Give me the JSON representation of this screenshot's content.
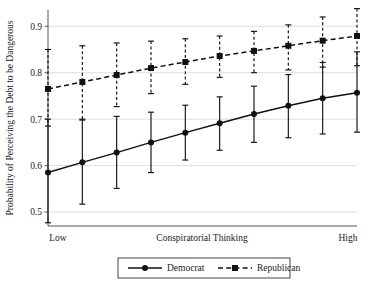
{
  "chart_data": {
    "type": "line",
    "title": "",
    "xlabel": "Conspiratorial Thinking",
    "ylabel": "Probability of Perceiving the Debt to be Dangerous",
    "xtick_labels": [
      "Low",
      "High"
    ],
    "ytick_labels": [
      "0.5",
      "0.6",
      "0.7",
      "0.8",
      "0.9"
    ],
    "yticks": [
      0.5,
      0.6,
      0.7,
      0.8,
      0.9
    ],
    "ylim": [
      0.47,
      0.935
    ],
    "xlim": [
      1,
      10
    ],
    "grid": "horizontal",
    "legend_position": "bottom-center",
    "x": [
      1,
      2,
      3,
      4,
      5,
      6,
      7,
      8,
      9,
      10
    ],
    "series": [
      {
        "name": "Democrat",
        "line_style": "solid",
        "marker": "circle",
        "color": "#111111",
        "values": [
          0.585,
          0.607,
          0.628,
          0.65,
          0.671,
          0.691,
          0.711,
          0.729,
          0.745,
          0.757
        ],
        "ci_low": [
          0.477,
          0.517,
          0.551,
          0.585,
          0.612,
          0.633,
          0.65,
          0.66,
          0.668,
          0.672
        ],
        "ci_high": [
          0.7,
          0.7,
          0.706,
          0.715,
          0.73,
          0.748,
          0.771,
          0.796,
          0.822,
          0.845
        ]
      },
      {
        "name": "Republican",
        "line_style": "dashed",
        "marker": "square",
        "color": "#111111",
        "values": [
          0.765,
          0.78,
          0.795,
          0.81,
          0.823,
          0.836,
          0.847,
          0.858,
          0.869,
          0.879
        ],
        "ci_low": [
          0.685,
          0.698,
          0.727,
          0.755,
          0.775,
          0.79,
          0.8,
          0.806,
          0.812,
          0.815
        ],
        "ci_high": [
          0.85,
          0.858,
          0.864,
          0.868,
          0.873,
          0.879,
          0.889,
          0.903,
          0.92,
          0.938
        ]
      }
    ],
    "legend": [
      {
        "label": "Democrat",
        "line_style": "solid",
        "marker": "circle"
      },
      {
        "label": "Republican",
        "line_style": "dashed",
        "marker": "square"
      }
    ]
  }
}
